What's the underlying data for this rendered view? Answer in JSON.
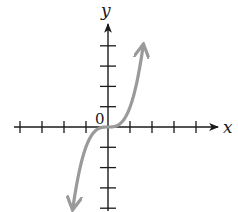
{
  "chart_data": {
    "type": "line",
    "title": "",
    "function": "y = x^3",
    "xlabel": "x",
    "ylabel": "y",
    "origin_label": "0",
    "xlim": [
      -4,
      4
    ],
    "ylim": [
      -4,
      4
    ],
    "x_ticks": [
      -4,
      -3,
      -2,
      -1,
      1,
      2,
      3,
      4
    ],
    "y_ticks": [
      -4,
      -3,
      -2,
      -1,
      1,
      2,
      3,
      4
    ],
    "grid": false,
    "series": [
      {
        "name": "curve",
        "color": "#9a9a9a",
        "x": [
          -1.6,
          -1.4,
          -1.2,
          -1.0,
          -0.8,
          -0.6,
          -0.4,
          -0.2,
          0,
          0.2,
          0.4,
          0.6,
          0.8,
          1.0,
          1.2,
          1.4,
          1.6
        ],
        "y": [
          -4.1,
          -2.74,
          -1.73,
          -1.0,
          -0.51,
          -0.22,
          -0.06,
          -0.01,
          0,
          0.01,
          0.06,
          0.22,
          0.51,
          1.0,
          1.73,
          2.74,
          4.1
        ],
        "arrows": "both"
      }
    ]
  },
  "labels": {
    "x": "x",
    "y": "y",
    "origin": "0"
  },
  "colors": {
    "axis": "#1a1a1a",
    "curve": "#9a9a9a"
  }
}
